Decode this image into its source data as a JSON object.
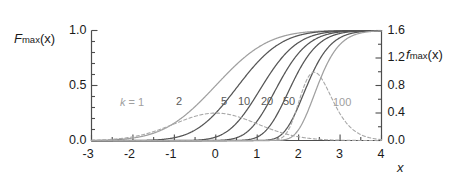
{
  "figure": {
    "background": "#ffffff",
    "axis_color": "#4d4d4d",
    "text_color": "#1a1a1a"
  },
  "axes": {
    "left_title_main": "F",
    "left_title_sub": "max",
    "left_title_arg": "(x)",
    "right_title_main": "f",
    "right_title_sub": "max",
    "right_title_arg": "(x)",
    "x_title": "x"
  },
  "ticks": {
    "x_labels": [
      "-3",
      "-2",
      "-1",
      "0",
      "1",
      "2",
      "3",
      "4"
    ],
    "x_values": [
      -3,
      -2,
      -1,
      0,
      1,
      2,
      3,
      4
    ],
    "y_left_labels": [
      "0.0",
      "0.5",
      "1.0"
    ],
    "y_left_values": [
      0.0,
      0.5,
      1.0
    ],
    "y_right_labels": [
      "0.0",
      "0.4",
      "0.8",
      "1.2",
      "1.6"
    ],
    "y_right_values": [
      0.0,
      0.4,
      0.8,
      1.2,
      1.6
    ]
  },
  "curve_labels": [
    {
      "text": "k = 1",
      "k": 1,
      "x": 120,
      "y": 96,
      "tone": "light"
    },
    {
      "text": "2",
      "k": 2,
      "x": 176,
      "y": 95,
      "tone": "dark"
    },
    {
      "text": "5",
      "k": 5,
      "x": 221,
      "y": 95,
      "tone": "dark"
    },
    {
      "text": "10",
      "k": 10,
      "x": 238,
      "y": 95,
      "tone": "dark"
    },
    {
      "text": "20",
      "k": 20,
      "x": 261,
      "y": 95,
      "tone": "dark"
    },
    {
      "text": "50",
      "k": 50,
      "x": 283,
      "y": 95,
      "tone": "dark"
    },
    {
      "text": "100",
      "k": 100,
      "x": 333,
      "y": 96,
      "tone": "light"
    }
  ],
  "chart_data": {
    "type": "line",
    "title": "",
    "xlabel": "x",
    "ylabel": "F_max(x)",
    "ylabel_right": "f_max(x)",
    "xlim": [
      -3,
      4
    ],
    "ylim": [
      0.0,
      1.0
    ],
    "ylim_right": [
      0.0,
      1.6
    ],
    "grid": false,
    "legend": "inline-curve-labels",
    "k_values": [
      1,
      2,
      5,
      10,
      20,
      50,
      100
    ],
    "solid_series_meaning": "cumulative distribution F_max(x), left axis 0 to 1",
    "dashed_series_meaning": "probability density f_max(x), right axis 0 to 1.6",
    "series": [
      {
        "name": "k = 1",
        "k": 1,
        "style": "solid",
        "color": "#a0a0a0",
        "axis": "left",
        "x": [
          -3.0,
          -2.5,
          -2.0,
          -1.5,
          -1.0,
          -0.5,
          0.0,
          0.5,
          1.0,
          1.5,
          2.0,
          2.5,
          3.0,
          3.5,
          4.0
        ],
        "values": [
          0.001,
          0.006,
          0.023,
          0.067,
          0.159,
          0.309,
          0.5,
          0.691,
          0.841,
          0.933,
          0.977,
          0.994,
          0.999,
          1.0,
          1.0
        ]
      },
      {
        "name": "k = 2",
        "k": 2,
        "style": "solid",
        "color": "#555555",
        "axis": "left",
        "x": [
          -3.0,
          -2.5,
          -2.0,
          -1.5,
          -1.0,
          -0.5,
          0.0,
          0.5,
          1.0,
          1.5,
          2.0,
          2.5,
          3.0,
          3.5,
          4.0
        ],
        "values": [
          0.0,
          0.0,
          0.001,
          0.004,
          0.025,
          0.096,
          0.25,
          0.477,
          0.708,
          0.871,
          0.955,
          0.988,
          0.997,
          1.0,
          1.0
        ]
      },
      {
        "name": "k = 5",
        "k": 5,
        "style": "solid",
        "color": "#555555",
        "axis": "left",
        "x": [
          -3.0,
          -2.5,
          -2.0,
          -1.5,
          -1.0,
          -0.5,
          0.0,
          0.5,
          1.0,
          1.5,
          2.0,
          2.5,
          3.0,
          3.5,
          4.0
        ],
        "values": [
          0.0,
          0.0,
          0.0,
          0.0,
          0.0,
          0.003,
          0.031,
          0.157,
          0.422,
          0.705,
          0.891,
          0.969,
          0.993,
          0.999,
          1.0
        ]
      },
      {
        "name": "k = 10",
        "k": 10,
        "style": "solid",
        "color": "#555555",
        "axis": "left",
        "x": [
          -3.0,
          -2.5,
          -2.0,
          -1.5,
          -1.0,
          -0.5,
          0.0,
          0.5,
          1.0,
          1.5,
          2.0,
          2.5,
          3.0,
          3.5,
          4.0
        ],
        "values": [
          0.0,
          0.0,
          0.0,
          0.0,
          0.0,
          0.0,
          0.001,
          0.025,
          0.178,
          0.497,
          0.794,
          0.94,
          0.987,
          0.998,
          1.0
        ]
      },
      {
        "name": "k = 20",
        "k": 20,
        "style": "solid",
        "color": "#555555",
        "axis": "left",
        "x": [
          -3.0,
          -2.5,
          -2.0,
          -1.5,
          -1.0,
          -0.5,
          0.0,
          0.5,
          1.0,
          1.5,
          2.0,
          2.5,
          3.0,
          3.5,
          4.0
        ],
        "values": [
          0.0,
          0.0,
          0.0,
          0.0,
          0.0,
          0.0,
          0.0,
          0.001,
          0.032,
          0.247,
          0.63,
          0.883,
          0.973,
          0.995,
          1.0
        ]
      },
      {
        "name": "k = 50",
        "k": 50,
        "style": "solid",
        "color": "#555555",
        "axis": "left",
        "x": [
          -3.0,
          -2.5,
          -2.0,
          -1.5,
          -1.0,
          -0.5,
          0.0,
          0.5,
          1.0,
          1.5,
          2.0,
          2.5,
          3.0,
          3.5,
          4.0
        ],
        "values": [
          0.0,
          0.0,
          0.0,
          0.0,
          0.0,
          0.0,
          0.0,
          0.0,
          0.0,
          0.03,
          0.315,
          0.741,
          0.934,
          0.988,
          0.998
        ]
      },
      {
        "name": "k = 100",
        "k": 100,
        "style": "solid",
        "color": "#a0a0a0",
        "axis": "left",
        "x": [
          -3.0,
          -2.5,
          -2.0,
          -1.5,
          -1.0,
          -0.5,
          0.0,
          0.5,
          1.0,
          1.5,
          2.0,
          2.5,
          3.0,
          3.5,
          4.0
        ],
        "values": [
          0.0,
          0.0,
          0.0,
          0.0,
          0.0,
          0.0,
          0.0,
          0.0,
          0.0,
          0.001,
          0.099,
          0.549,
          0.872,
          0.977,
          0.997
        ]
      },
      {
        "name": "density k = 1",
        "k": 1,
        "style": "dashed",
        "color": "#a8a8a8",
        "axis": "right",
        "peak_x": -0.15,
        "peak_y": 0.4,
        "x": [
          -3.0,
          -2.5,
          -2.0,
          -1.5,
          -1.0,
          -0.5,
          0.0,
          0.5,
          1.0,
          1.5,
          2.0,
          2.5,
          3.0,
          3.5,
          4.0
        ],
        "values": [
          0.004,
          0.018,
          0.054,
          0.13,
          0.242,
          0.352,
          0.399,
          0.352,
          0.242,
          0.13,
          0.054,
          0.018,
          0.004,
          0.001,
          0.0
        ]
      },
      {
        "name": "density k = 100",
        "k": 100,
        "style": "dashed",
        "color": "#a8a8a8",
        "axis": "right",
        "peak_x": 2.4,
        "peak_y": 1.4,
        "x": [
          1.5,
          1.7,
          1.9,
          2.0,
          2.1,
          2.2,
          2.3,
          2.4,
          2.5,
          2.6,
          2.8,
          3.0,
          3.2,
          3.4,
          3.6
        ],
        "values": [
          0.02,
          0.14,
          0.56,
          0.92,
          1.21,
          1.37,
          1.4,
          1.33,
          1.18,
          1.0,
          0.62,
          0.33,
          0.15,
          0.06,
          0.02
        ]
      }
    ]
  }
}
